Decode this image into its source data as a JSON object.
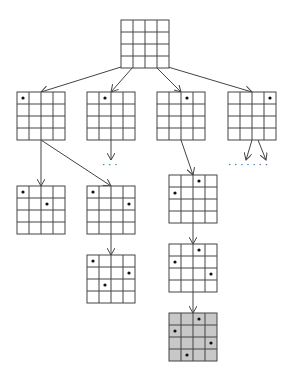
{
  "diagram": {
    "colors": {
      "line": "#444444",
      "grid_fill": "#ffffff",
      "solution_fill": "#c8c8c8",
      "queen": "#111111"
    },
    "grid_size": 4,
    "cell": 12,
    "nodes": [
      {
        "id": "root",
        "x": 121,
        "y": 20,
        "queens": [],
        "solution": false
      },
      {
        "id": "q00",
        "x": 17,
        "y": 92,
        "queens": [
          [
            0,
            0
          ]
        ],
        "solution": false
      },
      {
        "id": "q01",
        "x": 87,
        "y": 92,
        "queens": [
          [
            0,
            1
          ]
        ],
        "solution": false
      },
      {
        "id": "q02",
        "x": 157,
        "y": 92,
        "queens": [
          [
            0,
            2
          ]
        ],
        "solution": false
      },
      {
        "id": "q03",
        "x": 228,
        "y": 92,
        "queens": [
          [
            0,
            3
          ]
        ],
        "solution": false
      },
      {
        "id": "q00_12",
        "x": 17,
        "y": 186,
        "queens": [
          [
            0,
            0
          ],
          [
            1,
            2
          ]
        ],
        "solution": false
      },
      {
        "id": "q00_13",
        "x": 87,
        "y": 186,
        "queens": [
          [
            0,
            0
          ],
          [
            1,
            3
          ]
        ],
        "solution": false
      },
      {
        "id": "q00_13_21",
        "x": 87,
        "y": 255,
        "queens": [
          [
            0,
            0
          ],
          [
            1,
            3
          ],
          [
            2,
            1
          ]
        ],
        "solution": false
      },
      {
        "id": "q02_10",
        "x": 169,
        "y": 175,
        "queens": [
          [
            0,
            2
          ],
          [
            1,
            0
          ]
        ],
        "solution": false
      },
      {
        "id": "q02_10_23",
        "x": 169,
        "y": 244,
        "queens": [
          [
            0,
            2
          ],
          [
            1,
            0
          ],
          [
            2,
            3
          ]
        ],
        "solution": false
      },
      {
        "id": "q02_10_23_31",
        "x": 169,
        "y": 313,
        "queens": [
          [
            0,
            2
          ],
          [
            1,
            0
          ],
          [
            2,
            3
          ],
          [
            3,
            1
          ]
        ],
        "solution": true
      }
    ],
    "edges": [
      {
        "from": [
          121,
          67
        ],
        "to": [
          41,
          92
        ]
      },
      {
        "from": [
          133,
          67
        ],
        "to": [
          111,
          92
        ]
      },
      {
        "from": [
          156,
          67
        ],
        "to": [
          181,
          92
        ]
      },
      {
        "from": [
          168,
          67
        ],
        "to": [
          252,
          92
        ]
      },
      {
        "from": [
          41,
          140
        ],
        "to": [
          41,
          186
        ]
      },
      {
        "from": [
          41,
          140
        ],
        "to": [
          111,
          186
        ]
      },
      {
        "from": [
          111,
          140
        ],
        "to": [
          111,
          160
        ]
      },
      {
        "from": [
          181,
          140
        ],
        "to": [
          193,
          175
        ]
      },
      {
        "from": [
          252,
          140
        ],
        "to": [
          246,
          160
        ]
      },
      {
        "from": [
          258,
          140
        ],
        "to": [
          266,
          160
        ]
      },
      {
        "from": [
          111,
          234
        ],
        "to": [
          111,
          255
        ]
      },
      {
        "from": [
          193,
          222
        ],
        "to": [
          193,
          244
        ]
      },
      {
        "from": [
          193,
          291
        ],
        "to": [
          193,
          313
        ]
      }
    ],
    "ellipses": [
      {
        "label": "· · ·",
        "x": 102,
        "y": 168
      },
      {
        "label": "· · · · · · ·",
        "x": 228,
        "y": 168
      }
    ]
  }
}
